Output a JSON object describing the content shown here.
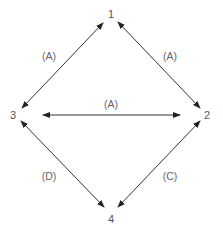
{
  "diagram": {
    "type": "directed-graph",
    "nodes": [
      {
        "id": "1",
        "label": "1",
        "x": 111,
        "y": 16
      },
      {
        "id": "2",
        "label": "2",
        "x": 207,
        "y": 118
      },
      {
        "id": "3",
        "label": "3",
        "x": 13,
        "y": 118
      },
      {
        "id": "4",
        "label": "4",
        "x": 111,
        "y": 221
      }
    ],
    "edges": [
      {
        "id": "e31",
        "from": "3",
        "to": "1",
        "label": "(A)",
        "bidirectional": true,
        "x1": 22,
        "y1": 108,
        "x2": 103,
        "y2": 23,
        "label_x": 49,
        "label_y": 60
      },
      {
        "id": "e12",
        "from": "1",
        "to": "2",
        "label": "(A)",
        "bidirectional": true,
        "x1": 118,
        "y1": 22,
        "x2": 200,
        "y2": 108,
        "label_x": 170,
        "label_y": 60
      },
      {
        "id": "e32",
        "from": "3",
        "to": "2",
        "label": "(A)",
        "bidirectional": true,
        "x1": 43,
        "y1": 115,
        "x2": 180,
        "y2": 115,
        "label_x": 111,
        "label_y": 108
      },
      {
        "id": "e34",
        "from": "3",
        "to": "4",
        "label": "(D)",
        "bidirectional": true,
        "x1": 21,
        "y1": 121,
        "x2": 104,
        "y2": 207,
        "label_x": 49,
        "label_y": 177
      },
      {
        "id": "e24",
        "from": "2",
        "to": "4",
        "label": "(C)",
        "bidirectional": true,
        "x1": 200,
        "y1": 121,
        "x2": 118,
        "y2": 207,
        "label_x": 170,
        "label_y": 177
      }
    ],
    "colors": {
      "line": "#333333",
      "node_text": "#555555",
      "edge_text": "#666666",
      "background": "#ffffff"
    }
  }
}
